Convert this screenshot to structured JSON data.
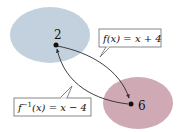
{
  "diagram": {
    "type": "function-inverse-mapping",
    "domain_set": {
      "color": "#c3d1de",
      "element": "2"
    },
    "range_set": {
      "color": "#cfa9b3",
      "element": "6"
    },
    "forward_label": {
      "parts": [
        "f(x) = x + 4"
      ],
      "text": "f(x) = x + 4"
    },
    "inverse_label": {
      "base": "f",
      "superscript": "−1",
      "rest": "(x) = x − 4"
    },
    "arrow_color": "#2a2a2a",
    "callout_border_color": "#555555"
  }
}
